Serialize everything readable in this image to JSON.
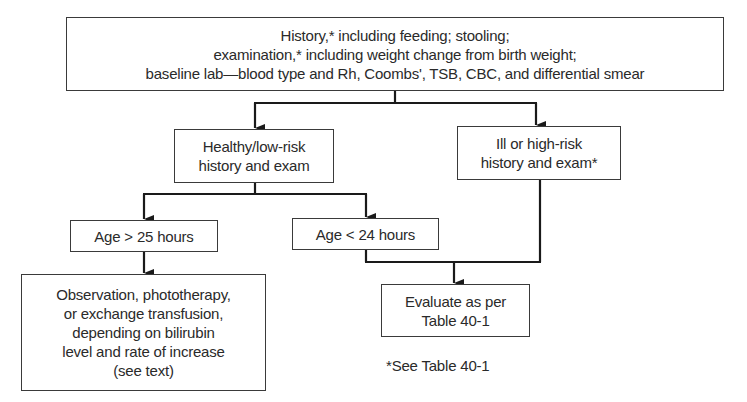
{
  "diagram": {
    "type": "flowchart",
    "nodes": {
      "top": {
        "lines": [
          "History,* including feeding; stooling;",
          "examination,* including weight change from birth weight;",
          "baseline lab—blood type and Rh, Coombs', TSB, CBC, and differential smear"
        ]
      },
      "healthy": {
        "lines": [
          "Healthy/low-risk",
          "history and exam"
        ]
      },
      "ill": {
        "lines": [
          "Ill or high-risk",
          "history and exam*"
        ]
      },
      "age_gt": {
        "lines": [
          "Age > 25 hours"
        ]
      },
      "age_lt": {
        "lines": [
          "Age < 24 hours"
        ]
      },
      "observation": {
        "lines": [
          "Observation, phototherapy,",
          "or exchange transfusion,",
          "depending on bilirubin",
          "level and rate of increase",
          "(see text)"
        ]
      },
      "evaluate": {
        "lines": [
          "Evaluate as per",
          "Table 40-1"
        ]
      }
    },
    "edges": [
      {
        "from": "top",
        "to": "healthy"
      },
      {
        "from": "top",
        "to": "ill"
      },
      {
        "from": "healthy",
        "to": "age_gt"
      },
      {
        "from": "healthy",
        "to": "age_lt"
      },
      {
        "from": "age_gt",
        "to": "observation"
      },
      {
        "from": "age_lt",
        "to": "evaluate"
      },
      {
        "from": "ill",
        "to": "evaluate"
      }
    ],
    "footnote": "*See Table 40-1",
    "colors": {
      "line": "#1a1a1a",
      "border": "#3a3a3a",
      "text": "#2a2a2a",
      "background": "#ffffff"
    }
  }
}
